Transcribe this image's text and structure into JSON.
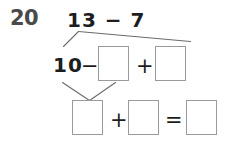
{
  "worksheet": {
    "problem_number": "20",
    "top_expression": "13 − 7",
    "row2": {
      "leading_number": "10",
      "minus_sign": "−",
      "plus_sign": "+",
      "box1_value": "",
      "box2_value": ""
    },
    "row3": {
      "plus_sign": "+",
      "equals_sign": "=",
      "box1_value": "",
      "box2_value": "",
      "box3_value": ""
    },
    "colors": {
      "background": "#ffffff",
      "number_gray": "#4a4a4a",
      "text_black": "#1d1d1d",
      "box_border": "#9a9a9a",
      "connector_line": "#6b6b6b"
    }
  }
}
